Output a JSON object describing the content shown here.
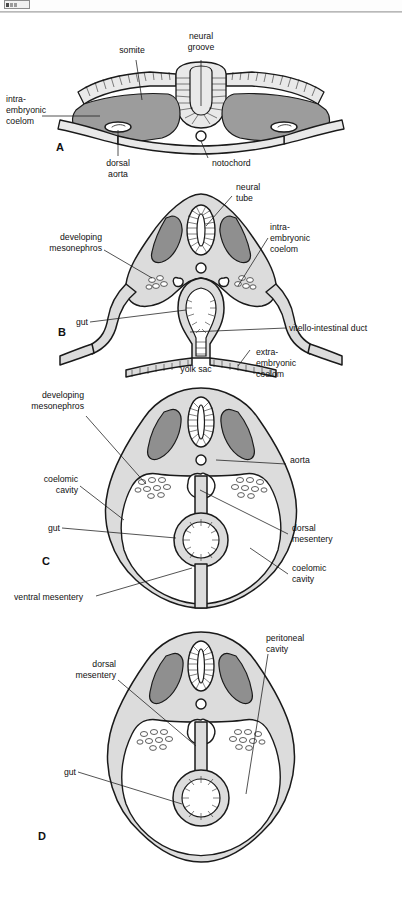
{
  "document": {
    "title": "Embryonic folding and formation of the coelom",
    "figure_type": "anatomical-diagram",
    "panel_count": 4
  },
  "toolbar": {
    "present": true,
    "note": "cropped toolbar strip at top edge"
  },
  "colors": {
    "ectoderm": "#e9e9e9",
    "mesoderm_dark": "#9c9c9c",
    "body_wall": "#dcdcdc",
    "cavity": "#ffffff",
    "stroke": "#1a1a1a",
    "page_background": "#ffffff"
  },
  "panels": [
    {
      "id": "A",
      "letter": "A",
      "caption": "Flat trilaminar embryo with open neural groove",
      "labels": [
        {
          "key": "somite",
          "text": "somite"
        },
        {
          "key": "neural_groove",
          "text_line1": "neural",
          "text_line2": "groove"
        },
        {
          "key": "intraembryonic",
          "text_line1": "intra-",
          "text_line2": "embryonic",
          "text_line3": "coelom"
        },
        {
          "key": "dorsal_aorta",
          "text_line1": "dorsal",
          "text_line2": "aorta"
        },
        {
          "key": "notochord",
          "text": "notochord"
        }
      ]
    },
    {
      "id": "B",
      "letter": "B",
      "caption": "Folding embryo with neural tube, gut and yolk sac connection",
      "labels": [
        {
          "key": "neural_tube",
          "text_line1": "neural",
          "text_line2": "tube"
        },
        {
          "key": "developing_meso",
          "text_line1": "developing",
          "text_line2": "mesonephros"
        },
        {
          "key": "intraembryonic",
          "text_line1": "intra-",
          "text_line2": "embryonic",
          "text_line3": "coelom"
        },
        {
          "key": "gut",
          "text": "gut"
        },
        {
          "key": "vitello_duct",
          "text": "vitello-intestinal duct"
        },
        {
          "key": "yolk_sac",
          "text": "yolk sac"
        },
        {
          "key": "extraembryonic",
          "text_line1": "extra-",
          "text_line2": "embryonic",
          "text_line3": "coelom"
        }
      ]
    },
    {
      "id": "C",
      "letter": "C",
      "caption": "Closed body wall with dorsal and ventral mesentery",
      "labels": [
        {
          "key": "developing_meso",
          "text_line1": "developing",
          "text_line2": "mesonephros"
        },
        {
          "key": "aorta",
          "text": "aorta"
        },
        {
          "key": "coelomic_left",
          "text_line1": "coelomic",
          "text_line2": "cavity"
        },
        {
          "key": "gut",
          "text": "gut"
        },
        {
          "key": "dorsal_mesentery",
          "text_line1": "dorsal",
          "text_line2": "mesentery"
        },
        {
          "key": "coelomic_right",
          "text_line1": "coelomic",
          "text_line2": "cavity"
        },
        {
          "key": "ventral_mesentery",
          "text": "ventral mesentery"
        }
      ]
    },
    {
      "id": "D",
      "letter": "D",
      "caption": "Definitive peritoneal cavity after loss of ventral mesentery",
      "labels": [
        {
          "key": "dorsal_mesentery",
          "text_line1": "dorsal",
          "text_line2": "mesentery"
        },
        {
          "key": "peritoneal_cavity",
          "text_line1": "peritoneal",
          "text_line2": "cavity"
        },
        {
          "key": "gut",
          "text": "gut"
        }
      ]
    }
  ]
}
